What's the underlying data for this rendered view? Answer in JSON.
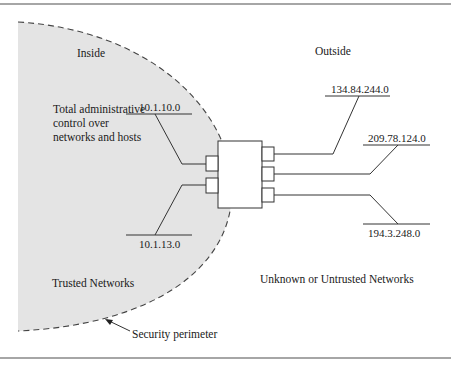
{
  "figure": {
    "regions": {
      "inside_label": "Inside",
      "outside_label": "Outside",
      "trusted_label": "Trusted Networks",
      "untrusted_label": "Unknown or Untrusted Networks"
    },
    "annotations": {
      "admin_control": "Total administrative control over networks and hosts",
      "perimeter": "Security perimeter"
    },
    "inside_networks": [
      {
        "address": "10.1.10.0"
      },
      {
        "address": "10.1.13.0"
      }
    ],
    "outside_networks": [
      {
        "address": "134.84.244.0"
      },
      {
        "address": "209.78.124.0"
      },
      {
        "address": "194.3.248.0"
      }
    ],
    "colors": {
      "trusted_fill": "#e4e4e4",
      "line": "#333333",
      "rule": "#888888"
    }
  }
}
